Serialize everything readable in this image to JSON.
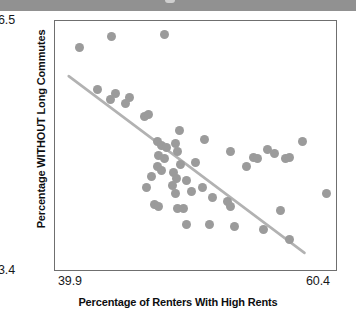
{
  "page": {
    "top_bar_present": true,
    "background_color": "#ffffff",
    "bar_color": "#919191"
  },
  "chart_data": {
    "type": "scatter",
    "title": "",
    "subtitle": "",
    "xlabel": "Percentage of Renters With High Rents",
    "ylabel": "Percentage WITHOUT Long Commutes",
    "xlim": [
      39.9,
      60.4
    ],
    "ylim": [
      83.4,
      96.5
    ],
    "xticks": [
      39.9,
      60.4
    ],
    "yticks": [
      83.4,
      96.5
    ],
    "xtick_labels": [
      "39.9",
      "60.4"
    ],
    "ytick_labels": [
      "83.4",
      "96.5"
    ],
    "grid": false,
    "legend": null,
    "legend_position": "none",
    "marker_color": "#9b9b9b",
    "marker_shape": "circle",
    "marker_size_px": 9,
    "trend_line": {
      "visible": true,
      "color": "#b2b2b2",
      "width_px": 2.6,
      "x_start": 40.9,
      "y_start": 93.6,
      "x_end": 58.1,
      "y_end": 84.3
    },
    "points": [
      {
        "x": 41.7,
        "y": 95.1
      },
      {
        "x": 44.0,
        "y": 95.7
      },
      {
        "x": 47.8,
        "y": 95.8
      },
      {
        "x": 43.0,
        "y": 92.9
      },
      {
        "x": 43.9,
        "y": 92.4
      },
      {
        "x": 44.3,
        "y": 92.7
      },
      {
        "x": 45.3,
        "y": 92.5
      },
      {
        "x": 46.4,
        "y": 91.5
      },
      {
        "x": 46.7,
        "y": 91.6
      },
      {
        "x": 48.9,
        "y": 90.8
      },
      {
        "x": 47.3,
        "y": 90.2
      },
      {
        "x": 47.6,
        "y": 90.0
      },
      {
        "x": 48.0,
        "y": 89.9
      },
      {
        "x": 47.4,
        "y": 89.5
      },
      {
        "x": 47.8,
        "y": 89.3
      },
      {
        "x": 48.6,
        "y": 90.1
      },
      {
        "x": 48.8,
        "y": 89.7
      },
      {
        "x": 47.3,
        "y": 88.9
      },
      {
        "x": 47.6,
        "y": 88.7
      },
      {
        "x": 50.7,
        "y": 90.3
      },
      {
        "x": 46.9,
        "y": 88.4
      },
      {
        "x": 48.5,
        "y": 88.6
      },
      {
        "x": 48.7,
        "y": 88.3
      },
      {
        "x": 49.0,
        "y": 89.0
      },
      {
        "x": 52.6,
        "y": 89.7
      },
      {
        "x": 54.3,
        "y": 89.4
      },
      {
        "x": 54.6,
        "y": 89.3
      },
      {
        "x": 55.3,
        "y": 89.8
      },
      {
        "x": 55.8,
        "y": 89.6
      },
      {
        "x": 56.6,
        "y": 89.3
      },
      {
        "x": 57.8,
        "y": 90.2
      },
      {
        "x": 56.9,
        "y": 89.4
      },
      {
        "x": 46.5,
        "y": 87.8
      },
      {
        "x": 48.4,
        "y": 87.9
      },
      {
        "x": 48.6,
        "y": 87.5
      },
      {
        "x": 49.4,
        "y": 88.2
      },
      {
        "x": 50.6,
        "y": 87.8
      },
      {
        "x": 51.3,
        "y": 87.3
      },
      {
        "x": 47.1,
        "y": 86.9
      },
      {
        "x": 47.4,
        "y": 86.8
      },
      {
        "x": 48.8,
        "y": 86.7
      },
      {
        "x": 49.2,
        "y": 86.7
      },
      {
        "x": 52.4,
        "y": 87.1
      },
      {
        "x": 52.6,
        "y": 86.8
      },
      {
        "x": 56.2,
        "y": 86.6
      },
      {
        "x": 49.4,
        "y": 85.9
      },
      {
        "x": 51.1,
        "y": 85.9
      },
      {
        "x": 52.9,
        "y": 85.8
      },
      {
        "x": 55.0,
        "y": 85.6
      },
      {
        "x": 56.9,
        "y": 85.1
      },
      {
        "x": 59.6,
        "y": 87.5
      },
      {
        "x": 45.0,
        "y": 92.2
      },
      {
        "x": 50.1,
        "y": 89.1
      },
      {
        "x": 49.8,
        "y": 87.6
      },
      {
        "x": 53.8,
        "y": 88.9
      }
    ]
  }
}
